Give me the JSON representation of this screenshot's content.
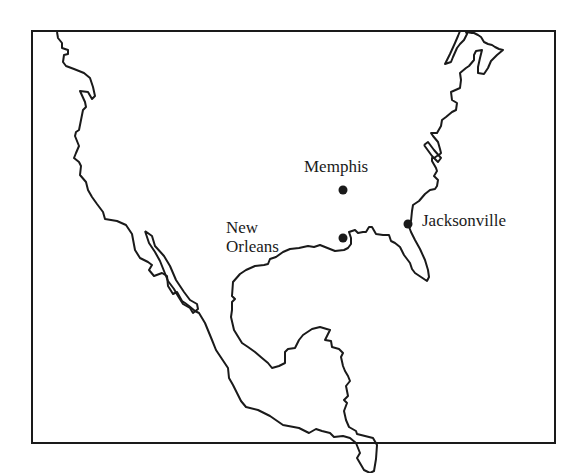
{
  "map": {
    "region": "North America (United States, Mexico, Central America)",
    "style": "outline coastline map",
    "colors": {
      "line": "#1a1a1a",
      "background": "#ffffff",
      "city_dot": "#1a1a1a"
    },
    "cities": [
      {
        "name": "Memphis",
        "label": "Memphis",
        "x": 343,
        "y": 190
      },
      {
        "name": "New Orleans",
        "label_line1": "New",
        "label_line2": "Orleans",
        "x": 343,
        "y": 238
      },
      {
        "name": "Jacksonville",
        "label": "Jacksonville",
        "x": 408,
        "y": 224
      }
    ]
  }
}
